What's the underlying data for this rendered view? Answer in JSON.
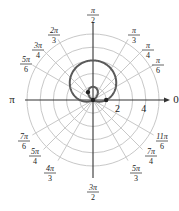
{
  "chart_data": {
    "type": "line",
    "subtype": "polar",
    "title": "",
    "equation": "r = 1 + 2 sin(theta)",
    "curve_description": "Limacon with inner loop",
    "radial_ticks": [
      2,
      4
    ],
    "radial_circles": [
      1,
      2,
      3,
      4,
      5
    ],
    "rmax": 5,
    "angle_labels": [
      {
        "angle_deg": 0,
        "text": "0"
      },
      {
        "angle_deg": 30,
        "num": "π",
        "den": "6"
      },
      {
        "angle_deg": 45,
        "num": "π",
        "den": "4"
      },
      {
        "angle_deg": 60,
        "num": "π",
        "den": "3"
      },
      {
        "angle_deg": 90,
        "num": "π",
        "den": "2"
      },
      {
        "angle_deg": 120,
        "num": "2π",
        "den": "3"
      },
      {
        "angle_deg": 135,
        "num": "3π",
        "den": "4"
      },
      {
        "angle_deg": 150,
        "num": "5π",
        "den": "6"
      },
      {
        "angle_deg": 180,
        "text": "π"
      },
      {
        "angle_deg": 210,
        "num": "7π",
        "den": "6"
      },
      {
        "angle_deg": 225,
        "num": "5π",
        "den": "4"
      },
      {
        "angle_deg": 240,
        "num": "4π",
        "den": "3"
      },
      {
        "angle_deg": 270,
        "num": "3π",
        "den": "2"
      },
      {
        "angle_deg": 300,
        "num": "5π",
        "den": "3"
      },
      {
        "angle_deg": 315,
        "num": "7π",
        "den": "4"
      },
      {
        "angle_deg": 330,
        "num": "11π",
        "den": "6"
      }
    ],
    "marked_points": [
      {
        "x": 0,
        "y": 0
      },
      {
        "x": 1,
        "y": 0
      },
      {
        "x": -0.38,
        "y": 0.6
      }
    ],
    "grid": true
  },
  "colors": {
    "grid": "#c8c8c8",
    "axis": "#333333",
    "curve": "#5a5a5a",
    "point": "#222222"
  }
}
